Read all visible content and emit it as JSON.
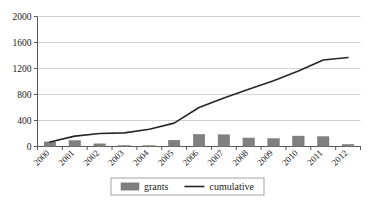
{
  "chart_data": {
    "type": "bar",
    "title": "",
    "xlabel": "",
    "ylabel": "",
    "categories": [
      "2000",
      "2001",
      "2002",
      "2003",
      "2004",
      "2005",
      "2006",
      "2007",
      "2008",
      "2009",
      "2010",
      "2011",
      "2012"
    ],
    "ylim": [
      0,
      2000
    ],
    "yticks": [
      0,
      400,
      800,
      1200,
      1600,
      2000
    ],
    "ytick_labels": [
      "0",
      "400",
      "800",
      "1200",
      "1600",
      "2000"
    ],
    "grid": true,
    "legend_position": "bottom-center",
    "series": [
      {
        "name": "grants",
        "type": "bar",
        "color": "#808080",
        "values": [
          70,
          90,
          40,
          10,
          10,
          95,
          185,
          180,
          130,
          120,
          160,
          150,
          30
        ]
      },
      {
        "name": "cumulative",
        "type": "line",
        "color": "#262626",
        "values": [
          70,
          160,
          200,
          210,
          265,
          360,
          600,
          745,
          880,
          1010,
          1160,
          1330,
          1370
        ]
      }
    ]
  },
  "axis": {
    "y_labels": [
      "2000",
      "1600",
      "1200",
      "800",
      "400",
      "0"
    ],
    "x_labels": [
      "2000",
      "2001",
      "2002",
      "2003",
      "2004",
      "2005",
      "2006",
      "2007",
      "2008",
      "2009",
      "2010",
      "2011",
      "2012"
    ]
  },
  "legend": {
    "items": [
      {
        "label": "grants",
        "marker": "swatch",
        "color": "#808080"
      },
      {
        "label": "cumulative",
        "marker": "line",
        "color": "#262626"
      }
    ]
  },
  "colors": {
    "bar": "#808080",
    "line": "#262626",
    "grid": "#c8c8c8",
    "axis": "#595959",
    "text": "#1a1a1a",
    "legend_border": "#8c8c8c"
  }
}
